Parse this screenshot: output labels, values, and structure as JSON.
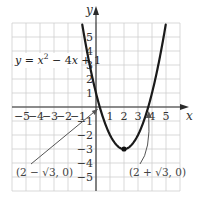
{
  "chart_data": {
    "type": "line",
    "title": "",
    "function": "y = x^2 - 4x + 1",
    "equation_label": {
      "lhs": "y",
      "eq": " = ",
      "x": "x",
      "sup": "2",
      "rest": " − 4",
      "x2": "x",
      "tail": " + 1"
    },
    "xlabel": "x",
    "ylabel": "y",
    "xlim": [
      -6,
      6
    ],
    "ylim": [
      -6,
      6
    ],
    "grid": true,
    "x_ticks": [
      -5,
      -4,
      -3,
      -2,
      -1,
      1,
      2,
      3,
      4,
      5
    ],
    "y_ticks": [
      -5,
      -4,
      -3,
      -2,
      -1,
      1,
      2,
      3,
      4,
      5
    ],
    "x_tick_labels": [
      "−5",
      "−4",
      "−3",
      "−2",
      "−1",
      "1",
      "2",
      "3",
      "4",
      "5"
    ],
    "y_tick_labels": [
      "−5",
      "−4",
      "−3",
      "−2",
      "−1",
      "1",
      "2",
      "3",
      "4",
      "5"
    ],
    "series": [
      {
        "name": "y = x^2 - 4x + 1",
        "coefficients": {
          "a": 1,
          "b": -4,
          "c": 1
        },
        "x_range": [
          -0.98,
          4.98
        ],
        "vertex": [
          2,
          -3
        ]
      }
    ],
    "annotations": [
      {
        "text": "(2 − √3, 0)",
        "point": [
          0.268,
          0
        ],
        "label_pos": "lower-left"
      },
      {
        "text": "(2 + √3, 0)",
        "point": [
          3.732,
          0
        ],
        "label_pos": "lower-right"
      }
    ]
  },
  "labels": {
    "x_axis": "x",
    "y_axis": "y",
    "root_left": "(2 − √3, 0)",
    "root_right": "(2 + √3, 0)"
  },
  "colors": {
    "grid": "#cfcfcf",
    "axis": "#2a2a2a",
    "curve": "#1a1a1a",
    "pointer": "#555555"
  }
}
